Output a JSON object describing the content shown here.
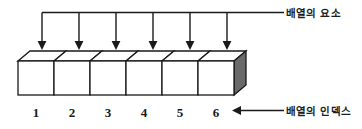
{
  "diagram": {
    "type": "array-structure-diagram",
    "title_top_right": "배열의 요소",
    "title_bottom_right": "배열의 인덱스",
    "cell_count": 6,
    "indices": [
      "1",
      "2",
      "3",
      "4",
      "5",
      "6"
    ],
    "colors": {
      "outline": "#1a1a1a",
      "cell_face": "#ffffff",
      "top_face": "#ffffff",
      "right_side_face": "#6a6a6a",
      "text": "#1a1a1a",
      "background": "#ffffff"
    },
    "annotations": {
      "element_arrows": "six downward arrows from a horizontal bus line pointing into each cell top face",
      "index_arrow": "leftward arrow from the index label toward the number row"
    }
  }
}
